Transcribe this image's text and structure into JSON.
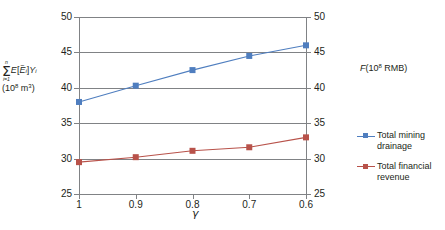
{
  "chart_data": {
    "type": "line",
    "title": "",
    "subtitle": "",
    "xlabel": "γ",
    "ylabel": "Σ E[Ẽᵢ]Yᵢ (10⁸ m³)",
    "ylabel_right": "F(10⁸ RMB)",
    "x": [
      1,
      0.9,
      0.8,
      0.7,
      0.6
    ],
    "categories": [
      "1",
      "0.9",
      "0.8",
      "0.7",
      "0.6"
    ],
    "ylim": [
      25,
      50
    ],
    "ylim_right": [
      25,
      50
    ],
    "yticks": [
      25,
      30,
      35,
      40,
      45,
      50
    ],
    "yticks_right": [
      25,
      30,
      35,
      40,
      45,
      50
    ],
    "grid": true,
    "legend_position": "right",
    "series": [
      {
        "name": "Total mining drainage",
        "axis": "left",
        "color": "#4f7ebf",
        "marker": "square",
        "values": [
          38.0,
          40.3,
          42.5,
          44.5,
          46.0
        ]
      },
      {
        "name": "Total financial revenue",
        "axis": "right",
        "color": "#b8524a",
        "marker": "square",
        "values": [
          29.5,
          30.2,
          31.1,
          31.6,
          33.0
        ]
      }
    ]
  },
  "axis_titles": {
    "left": {
      "sigma_upper": "n",
      "sigma_lower": "i=1",
      "expression_e": "E",
      "bracket_open": "[",
      "e_tilde": "E",
      "tilde": "~",
      "e_sub": "i",
      "bracket_close": "]",
      "y": "Y",
      "y_sub": "i",
      "units": "(10",
      "units_sup": "8",
      "units_tail": " m",
      "units_tail_sup": "3",
      "units_close": ")"
    },
    "right": {
      "f": "F",
      "paren_open": "(10",
      "exp": "8",
      "tail": " RMB)"
    },
    "x": "γ"
  },
  "ticks": {
    "y_left": [
      "50",
      "45",
      "40",
      "35",
      "30",
      "25"
    ],
    "y_right": [
      "50",
      "45",
      "40",
      "35",
      "30",
      "25"
    ],
    "x": [
      "1",
      "0.9",
      "0.8",
      "0.7",
      "0.6"
    ]
  },
  "legend": {
    "items": [
      {
        "label_line1": "Total mining",
        "label_line2": "drainage",
        "color": "#4f7ebf"
      },
      {
        "label_line1": "Total financial",
        "label_line2": "revenue",
        "color": "#b8524a"
      }
    ]
  },
  "colors": {
    "series_blue": "#4f7ebf",
    "series_red": "#b8524a",
    "axis": "#808285",
    "text": "#231f20",
    "background": "#ffffff"
  }
}
